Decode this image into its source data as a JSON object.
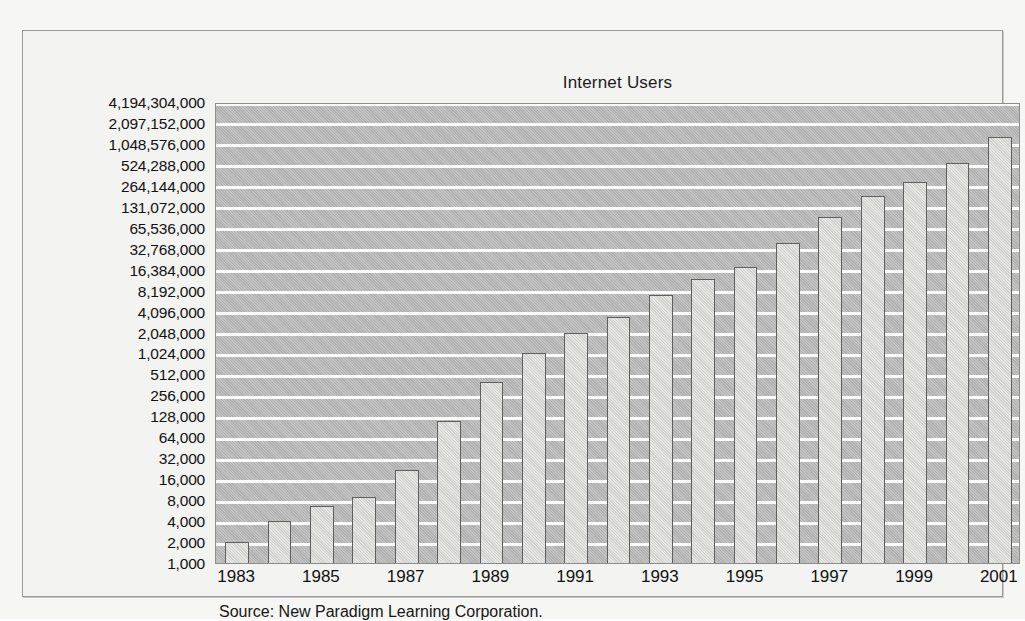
{
  "figure": {
    "title": "Internet Users",
    "source_note": "Source: New Paradigm Learning Corporation."
  },
  "chart_data": {
    "type": "bar",
    "title": "Internet Users",
    "xlabel": "",
    "ylabel": "",
    "yscale": "log2",
    "grid": true,
    "legend": false,
    "categories": [
      "1983",
      "1984",
      "1985",
      "1986",
      "1987",
      "1988",
      "1989",
      "1990",
      "1991",
      "1992",
      "1993",
      "1994",
      "1995",
      "1996",
      "1997",
      "1998",
      "1999",
      "2000",
      "2001"
    ],
    "x_tick_labels": [
      "1983",
      "1985",
      "1987",
      "1989",
      "1991",
      "1993",
      "1995",
      "1997",
      "1999",
      "2001"
    ],
    "values": [
      2000,
      4000,
      6500,
      9000,
      22000,
      110000,
      400000,
      1024000,
      2048000,
      3400000,
      7000000,
      12000000,
      18000000,
      40000000,
      95000000,
      190000000,
      300000000,
      560000000,
      1300000000
    ],
    "y_tick_labels": [
      "4,194,304,000",
      "2,097,152,000",
      "1,048,576,000",
      "524,288,000",
      "264,144,000",
      "131,072,000",
      "65,536,000",
      "32,768,000",
      "16,384,000",
      "8,192,000",
      "4,096,000",
      "2,048,000",
      "1,024,000",
      "512,000",
      "256,000",
      "128,000",
      "64,000",
      "32,000",
      "16,000",
      "8,000",
      "4,000",
      "2,000",
      "1,000"
    ],
    "y_tick_values": [
      4194304000,
      2097152000,
      1048576000,
      524288000,
      264144000,
      131072000,
      65536000,
      32768000,
      16384000,
      8192000,
      4096000,
      2048000,
      1024000,
      512000,
      256000,
      128000,
      64000,
      32000,
      16000,
      8000,
      4000,
      2000,
      1000
    ],
    "ylim": [
      1000,
      4194304000
    ],
    "colors": {
      "plot_background": "#b7b7b7",
      "gridline": "#fbfbfb",
      "bar_fill": "#d8d8d6",
      "bar_border": "#5f5f5f",
      "page_background": "#f3f3f1",
      "text": "#121212"
    }
  }
}
